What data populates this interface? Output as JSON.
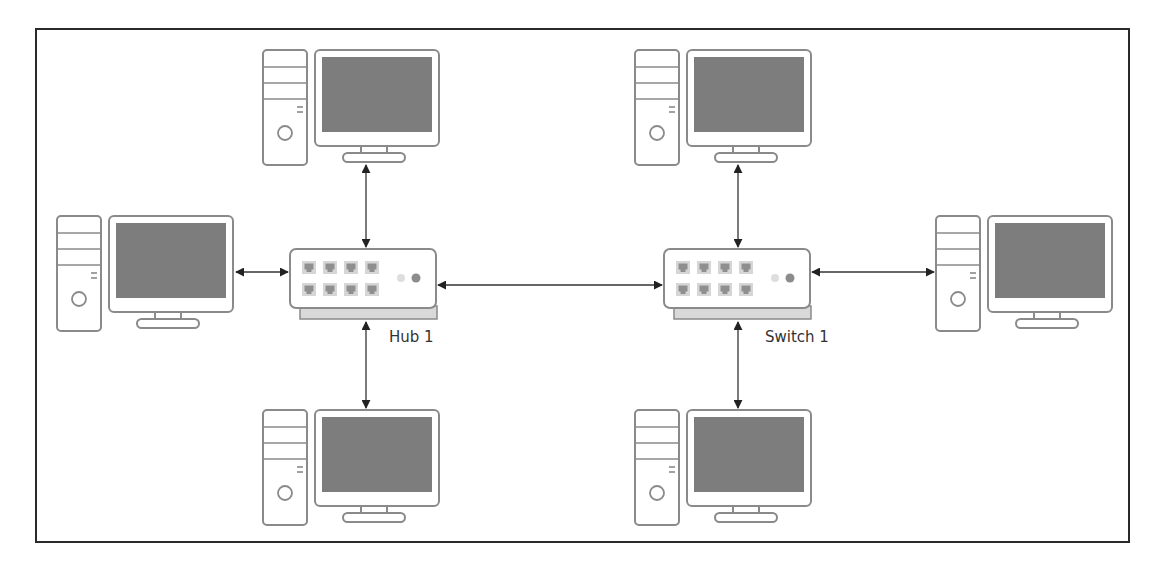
{
  "diagram": {
    "title": "",
    "colors": {
      "frame": "#2a2a2a",
      "outline": "#8a8a8a",
      "screen": "#7d7d7d",
      "port": "#9a9a9a",
      "port_bg": "#d6d6d6",
      "base": "#d9d9d9",
      "led_light": "#dedede",
      "led_dark": "#8c8c8c",
      "link": "#333333",
      "label": "#333333"
    },
    "devices": {
      "hub": {
        "label": "Hub 1",
        "type": "hub"
      },
      "switch": {
        "label": "Switch 1",
        "type": "switch"
      }
    },
    "computers": [
      {
        "id": "pc-hub-top",
        "connected_to": "Hub 1"
      },
      {
        "id": "pc-hub-left",
        "connected_to": "Hub 1"
      },
      {
        "id": "pc-hub-bottom",
        "connected_to": "Hub 1"
      },
      {
        "id": "pc-switch-top",
        "connected_to": "Switch 1"
      },
      {
        "id": "pc-switch-right",
        "connected_to": "Switch 1"
      },
      {
        "id": "pc-switch-bottom",
        "connected_to": "Switch 1"
      }
    ],
    "links": [
      {
        "from": "pc-hub-top",
        "to": "Hub 1",
        "direction": "bidirectional"
      },
      {
        "from": "pc-hub-left",
        "to": "Hub 1",
        "direction": "bidirectional"
      },
      {
        "from": "pc-hub-bottom",
        "to": "Hub 1",
        "direction": "bidirectional"
      },
      {
        "from": "Hub 1",
        "to": "Switch 1",
        "direction": "bidirectional"
      },
      {
        "from": "pc-switch-top",
        "to": "Switch 1",
        "direction": "bidirectional"
      },
      {
        "from": "pc-switch-right",
        "to": "Switch 1",
        "direction": "bidirectional"
      },
      {
        "from": "pc-switch-bottom",
        "to": "Switch 1",
        "direction": "bidirectional"
      }
    ]
  }
}
